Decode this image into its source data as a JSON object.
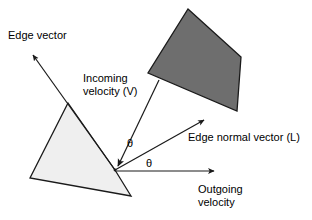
{
  "figure": {
    "type": "vector-reflection-diagram",
    "background_color": "#ffffff",
    "stroke_color": "#1a1a1a",
    "labels": {
      "edge_vector": "Edge vector",
      "incoming_velocity_line1": "Incoming",
      "incoming_velocity_line2": "velocity (V)",
      "edge_normal_vector": "Edge normal vector (L)",
      "outgoing_velocity_line1": "Outgoing",
      "outgoing_velocity_line2": "velocity",
      "theta_incoming": "θ",
      "theta_outgoing": "θ"
    },
    "shapes": [
      {
        "name": "dark-polygon",
        "fill": "#6e6e6e",
        "stroke": "#1a1a1a",
        "points": "188,9 241,57 237,111 148,73"
      },
      {
        "name": "light-polygon",
        "fill": "#efefef",
        "stroke": "#1a1a1a",
        "points": "68,103 115,170 131,196 30,178"
      }
    ],
    "vectors": [
      {
        "name": "edge-vector-arrow",
        "from": [
          115,
          170
        ],
        "to": [
          31,
          53
        ],
        "arrowhead": true
      },
      {
        "name": "incoming-velocity-arrow",
        "from": [
          158,
          82
        ],
        "to": [
          117,
          167
        ],
        "arrowhead": true
      },
      {
        "name": "edge-normal-vector-arrow",
        "from": [
          115,
          170
        ],
        "to": [
          206,
          119
        ],
        "arrowhead": true
      },
      {
        "name": "outgoing-velocity-arrow",
        "from": [
          115,
          170
        ],
        "to": [
          216,
          171
        ],
        "arrowhead": true
      }
    ],
    "vertex": {
      "name": "reflection-vertex",
      "point": [
        115,
        170
      ]
    }
  }
}
